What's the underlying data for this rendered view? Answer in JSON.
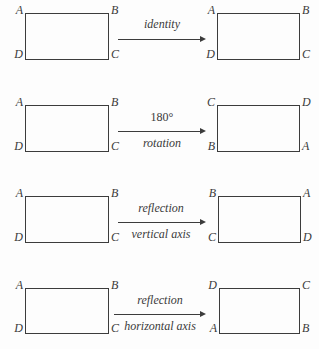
{
  "figure": {
    "ink_color": "#3a3a3a",
    "background_color": "#fdfdfd",
    "rows": [
      {
        "id": "identity",
        "label_upper": "identity",
        "label_lower": "",
        "label_upper_upright": false,
        "source": {
          "tl": "A",
          "tr": "B",
          "bl": "D",
          "br": "C"
        },
        "target": {
          "tl": "A",
          "tr": "B",
          "bl": "D",
          "br": "C"
        }
      },
      {
        "id": "rotation-180",
        "label_upper": "180°",
        "label_lower": "rotation",
        "label_upper_upright": true,
        "source": {
          "tl": "A",
          "tr": "B",
          "bl": "D",
          "br": "C"
        },
        "target": {
          "tl": "C",
          "tr": "D",
          "bl": "B",
          "br": "A"
        }
      },
      {
        "id": "reflection-vertical-axis",
        "label_upper": "reflection",
        "label_lower": "vertical axis",
        "label_upper_upright": false,
        "source": {
          "tl": "A",
          "tr": "B",
          "bl": "D",
          "br": "C"
        },
        "target": {
          "tl": "B",
          "tr": "A",
          "bl": "C",
          "br": "D"
        }
      },
      {
        "id": "reflection-horizontal-axis",
        "label_upper": "reflection",
        "label_lower": "horizontal axis",
        "label_upper_upright": false,
        "source": {
          "tl": "A",
          "tr": "B",
          "bl": "D",
          "br": "C"
        },
        "target": {
          "tl": "D",
          "tr": "C",
          "bl": "A",
          "br": "B"
        }
      }
    ]
  }
}
